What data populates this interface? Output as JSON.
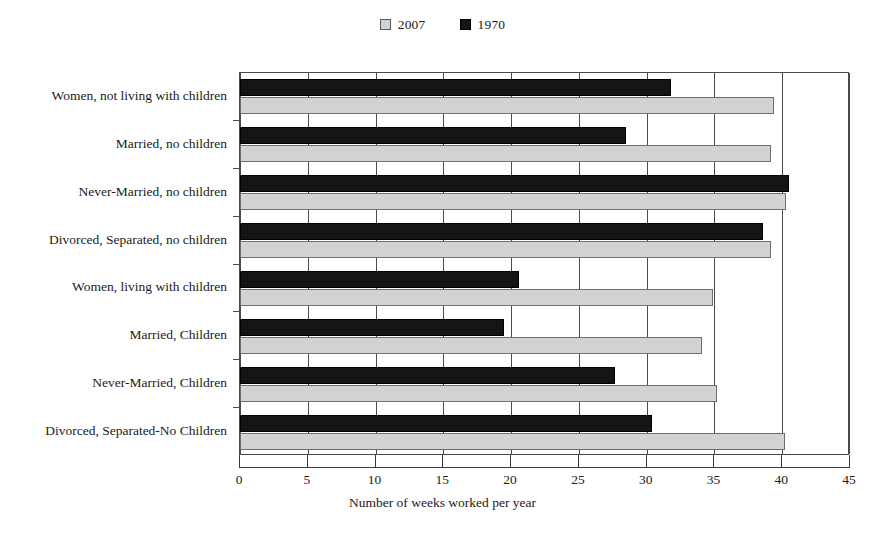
{
  "chart_data": {
    "type": "bar",
    "orientation": "horizontal",
    "title": "",
    "xlabel": "Number of weeks worked per year",
    "ylabel": "",
    "xlim": [
      0,
      45
    ],
    "xticks": [
      0,
      5,
      10,
      15,
      20,
      25,
      30,
      35,
      40,
      45
    ],
    "grid": true,
    "grid_axis": "x",
    "legend_position": "top-center",
    "categories": [
      "Women, not living with children",
      "Married, no children",
      "Never-Married, no children",
      "Divorced, Separated, no children",
      "Women, living with children",
      "Married, Children",
      "Never-Married, Children",
      "Divorced, Separated-No Children"
    ],
    "series": [
      {
        "name": "2007",
        "color": "#d2d2d2",
        "values": [
          39.4,
          39.2,
          40.3,
          39.2,
          34.9,
          34.1,
          35.2,
          40.2
        ]
      },
      {
        "name": "1970",
        "color": "#151515",
        "values": [
          31.8,
          28.5,
          40.5,
          38.6,
          20.6,
          19.5,
          27.7,
          30.4
        ]
      }
    ]
  },
  "legend": {
    "entries": [
      {
        "label": "2007",
        "swatch": "light-gray-swatch-icon"
      },
      {
        "label": "1970",
        "swatch": "black-swatch-icon"
      }
    ]
  },
  "axis": {
    "x_title": "Number of weeks worked per year",
    "x_tick_labels": [
      "0",
      "5",
      "10",
      "15",
      "20",
      "25",
      "30",
      "35",
      "40",
      "45"
    ]
  }
}
